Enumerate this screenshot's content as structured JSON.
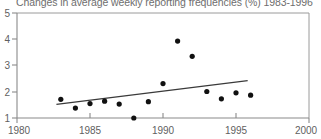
{
  "chart_data": {
    "type": "scatter",
    "title": "Changes in average weekly reporting frequencies (%) 1983-1996",
    "xlabel": "",
    "ylabel": "",
    "xlim": [
      1980,
      2000
    ],
    "ylim": [
      1,
      5
    ],
    "xticks": [
      1980,
      1985,
      1990,
      1995,
      2000
    ],
    "yticks": [
      1,
      2,
      3,
      4,
      5
    ],
    "grid": false,
    "legend": null,
    "x": [
      1983,
      1984,
      1985,
      1986,
      1987,
      1988,
      1989,
      1990,
      1991,
      1992,
      1993,
      1994,
      1995,
      1996
    ],
    "values": [
      1.71,
      1.38,
      1.55,
      1.64,
      1.53,
      1.0,
      1.62,
      2.31,
      3.93,
      3.35,
      2.01,
      1.73,
      1.96,
      1.87
    ],
    "series": [
      {
        "name": "Average weekly reporting frequency change",
        "type": "scatter",
        "x": [
          1983,
          1984,
          1985,
          1986,
          1987,
          1988,
          1989,
          1990,
          1991,
          1992,
          1993,
          1994,
          1995,
          1996
        ],
        "values": [
          1.71,
          1.38,
          1.55,
          1.64,
          1.53,
          1.0,
          1.62,
          2.31,
          3.93,
          3.35,
          2.01,
          1.73,
          1.96,
          1.87
        ]
      },
      {
        "name": "Linear trend",
        "type": "line",
        "x": [
          1982.7,
          1995.8
        ],
        "values": [
          1.52,
          2.42
        ]
      }
    ]
  },
  "axes": {
    "y_tick_labels": [
      "1",
      "2",
      "3",
      "4",
      "5"
    ],
    "x_tick_labels": [
      "1980",
      "1985",
      "1990",
      "1995",
      "2000"
    ]
  },
  "colors": {
    "point": "#111111",
    "trend": "#3a3a3a",
    "axis": "#8a8a8a",
    "title_text": "#6e6e6e",
    "tick_text": "#5f5f5f",
    "background": "#ffffff"
  }
}
